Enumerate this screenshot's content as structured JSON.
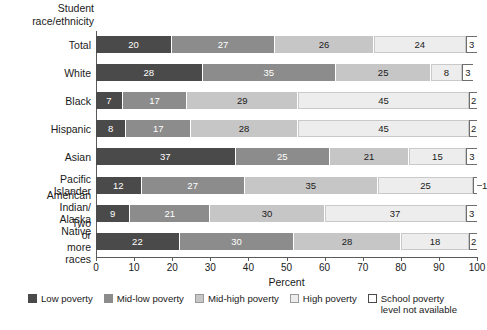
{
  "chart_data": {
    "type": "bar",
    "orientation": "horizontal",
    "stacked": true,
    "title": "",
    "group_axis_title": "Student\nrace/ethnicity",
    "xlabel": "Percent",
    "ylabel": "",
    "xlim": [
      0,
      100
    ],
    "xticks": [
      0,
      10,
      20,
      30,
      40,
      50,
      60,
      70,
      80,
      90,
      100
    ],
    "grid": false,
    "legend_position": "bottom",
    "categories": [
      "Total",
      "White",
      "Black",
      "Hispanic",
      "Asian",
      "Pacific Islander",
      "American Indian/\nAlaska Native",
      "Two or more races"
    ],
    "series": [
      {
        "name": "Low poverty",
        "color": "#4a4a4a",
        "values": [
          20,
          28,
          7,
          8,
          37,
          12,
          9,
          22
        ]
      },
      {
        "name": "Mid-low poverty",
        "color": "#8c8c8c",
        "values": [
          27,
          35,
          17,
          17,
          25,
          27,
          21,
          30
        ]
      },
      {
        "name": "Mid-high poverty",
        "color": "#c6c6c6",
        "values": [
          26,
          25,
          29,
          28,
          21,
          35,
          30,
          28
        ]
      },
      {
        "name": "High poverty",
        "color": "#ededed",
        "values": [
          24,
          8,
          45,
          45,
          15,
          25,
          37,
          18
        ]
      },
      {
        "name": "School poverty\nlevel not available",
        "color": "#ffffff",
        "values": [
          3,
          3,
          2,
          2,
          3,
          1,
          3,
          2
        ]
      }
    ],
    "label_outside": [
      {
        "row": 5,
        "series": 4,
        "value": 1
      }
    ]
  },
  "legend": {
    "items": [
      {
        "label": "Low poverty",
        "swatch": "c0"
      },
      {
        "label": "Mid-low poverty",
        "swatch": "c1"
      },
      {
        "label": "Mid-high poverty",
        "swatch": "c2"
      },
      {
        "label": "High poverty",
        "swatch": "c3"
      },
      {
        "label": "School poverty\nlevel not available",
        "swatch": "c4"
      }
    ]
  }
}
